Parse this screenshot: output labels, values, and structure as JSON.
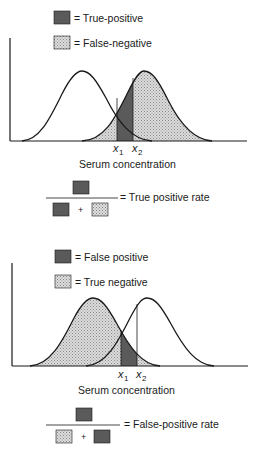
{
  "panels": [
    {
      "legend": [
        {
          "swatch": "dark",
          "label": "= True-positive"
        },
        {
          "swatch": "stipple",
          "label": "= False-negative"
        }
      ],
      "x_markers": [
        {
          "base": "x",
          "sub": "1"
        },
        {
          "base": "x",
          "sub": "2"
        }
      ],
      "xlabel": "Serum concentration",
      "formula": {
        "numerator": "dark",
        "denominator": [
          "dark",
          "+",
          "stipple"
        ],
        "result": "= True positive rate"
      }
    },
    {
      "legend": [
        {
          "swatch": "dark",
          "label": "= False positive"
        },
        {
          "swatch": "stipple",
          "label": "= True negative"
        }
      ],
      "x_markers": [
        {
          "base": "x",
          "sub": "1"
        },
        {
          "base": "x",
          "sub": "2"
        }
      ],
      "xlabel": "Serum concentration",
      "formula": {
        "numerator": "dark",
        "denominator": [
          "stipple",
          "+",
          "dark"
        ],
        "result": "= False-positive rate"
      }
    }
  ],
  "colors": {
    "dark": "#5a5a5a",
    "stipple_bg": "#d6d6d6",
    "stipple_dot": "#8c8c8c",
    "line": "#1a1a1a"
  },
  "plus": "+"
}
